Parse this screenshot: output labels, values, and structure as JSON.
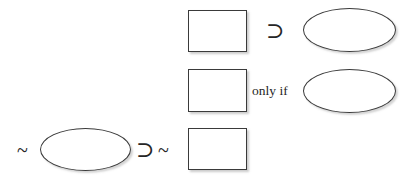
{
  "diagram": {
    "background_color": "#ffffff",
    "stroke_color": "#3a3a3a",
    "text_color": "#262626",
    "rows": [
      {
        "id": "row-1",
        "elements": [
          {
            "kind": "rectangle",
            "name": "square-placeholder-1",
            "label": ""
          },
          {
            "kind": "symbol",
            "name": "horseshoe-symbol-1",
            "label": "⊃"
          },
          {
            "kind": "ellipse",
            "name": "ellipse-placeholder-1",
            "label": ""
          }
        ]
      },
      {
        "id": "row-2",
        "elements": [
          {
            "kind": "rectangle",
            "name": "square-placeholder-2",
            "label": ""
          },
          {
            "kind": "text",
            "name": "only-if-text",
            "label": "only if"
          },
          {
            "kind": "ellipse",
            "name": "ellipse-placeholder-2",
            "label": ""
          }
        ]
      },
      {
        "id": "row-3",
        "elements": [
          {
            "kind": "symbol",
            "name": "tilde-symbol-1",
            "label": "~"
          },
          {
            "kind": "ellipse",
            "name": "ellipse-placeholder-3",
            "label": ""
          },
          {
            "kind": "symbol",
            "name": "horseshoe-symbol-2",
            "label": "⊃"
          },
          {
            "kind": "symbol",
            "name": "tilde-symbol-2",
            "label": "~"
          },
          {
            "kind": "rectangle",
            "name": "square-placeholder-3",
            "label": ""
          }
        ]
      }
    ]
  }
}
